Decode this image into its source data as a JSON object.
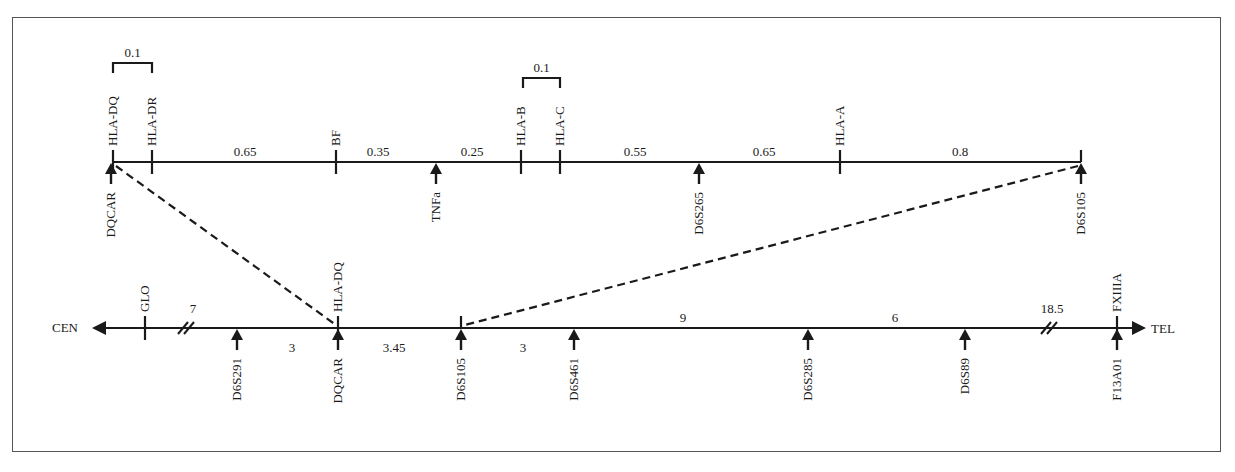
{
  "diagram": {
    "title": "",
    "top_map": {
      "markers_above": [
        {
          "name": "HLA-DQ",
          "x": 113
        },
        {
          "name": "HLA-DR",
          "x": 152
        },
        {
          "name": "BF",
          "x": 336
        },
        {
          "name": "HLA-B",
          "x": 521
        },
        {
          "name": "HLA-C",
          "x": 560
        },
        {
          "name": "HLA-A",
          "x": 840
        }
      ],
      "markers_below": [
        {
          "name": "DQCAR",
          "x": 111
        },
        {
          "name": "TNFa",
          "x": 436
        },
        {
          "name": "D6S265",
          "x": 699
        },
        {
          "name": "D6S105",
          "x": 1081
        }
      ],
      "distances": [
        {
          "value": "0.65",
          "x": 245
        },
        {
          "value": "0.35",
          "x": 378
        },
        {
          "value": "0.25",
          "x": 472
        },
        {
          "value": "0.55",
          "x": 635
        },
        {
          "value": "0.65",
          "x": 764
        },
        {
          "value": "0.8",
          "x": 960
        }
      ],
      "brackets": [
        {
          "value": "0.1",
          "x1": 113,
          "x2": 152
        },
        {
          "value": "0.1",
          "x1": 523,
          "x2": 560
        }
      ]
    },
    "bottom_map": {
      "left_end": "CEN",
      "right_end": "TEL",
      "markers_above": [
        {
          "name": "GLO",
          "x": 145
        },
        {
          "name": "HLA-DQ",
          "x": 338
        },
        {
          "name": "FXIIIA",
          "x": 1117
        }
      ],
      "markers_below": [
        {
          "name": "D6S291",
          "x": 237
        },
        {
          "name": "DQCAR",
          "x": 338
        },
        {
          "name": "D6S105",
          "x": 461
        },
        {
          "name": "D6S461",
          "x": 574
        },
        {
          "name": "D6S285",
          "x": 808
        },
        {
          "name": "D6S89",
          "x": 965
        },
        {
          "name": "F13A01",
          "x": 1117
        }
      ],
      "distances": [
        {
          "value": "7",
          "x": 193,
          "y": 313
        },
        {
          "value": "3",
          "x": 292,
          "y": 352
        },
        {
          "value": "3.45",
          "x": 394,
          "y": 352
        },
        {
          "value": "3",
          "x": 523,
          "y": 352
        },
        {
          "value": "9",
          "x": 683,
          "y": 322
        },
        {
          "value": "6",
          "x": 895,
          "y": 322
        },
        {
          "value": "18.5",
          "x": 1052,
          "y": 313
        }
      ],
      "breaks": [
        {
          "x": 187
        },
        {
          "x": 1050
        }
      ]
    },
    "connectors": [
      {
        "from": "DQCAR (top)",
        "to": "DQCAR (bottom)"
      },
      {
        "from": "D6S105 (top)",
        "to": "D6S105 (bottom)"
      }
    ]
  }
}
